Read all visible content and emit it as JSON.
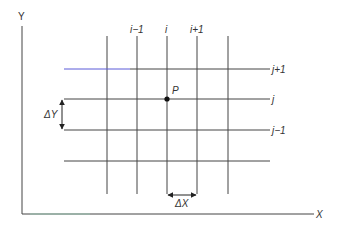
{
  "axes": {
    "x_label": "X",
    "y_label": "Y"
  },
  "columns": [
    {
      "label": "",
      "x": 107
    },
    {
      "label": "i−1",
      "x": 137
    },
    {
      "label": "i",
      "x": 167
    },
    {
      "label": "i+1",
      "x": 197
    },
    {
      "label": "",
      "x": 228
    }
  ],
  "rows": [
    {
      "label": "j+1",
      "y": 69
    },
    {
      "label": "j",
      "y": 99
    },
    {
      "label": "j−1",
      "y": 130
    },
    {
      "label": "",
      "y": 161
    }
  ],
  "point": {
    "label": "P",
    "x": 167,
    "y": 99
  },
  "spacing": {
    "dx_label": "ΔX",
    "dy_label": "ΔY"
  },
  "colors": {
    "line": "#333333",
    "top_line_left": "#5a5ad8"
  }
}
